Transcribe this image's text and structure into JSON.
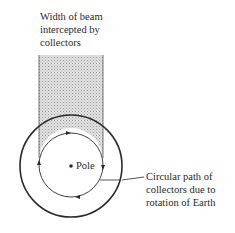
{
  "diagram": {
    "beam_label": [
      "Width of beam",
      "intercepted by",
      "collectors"
    ],
    "pole_label": "Pole",
    "path_label": [
      "Circular path of",
      "collectors due to",
      "rotation of Earth"
    ],
    "colors": {
      "stroke": "#2a2a2a",
      "beam_fill": "#d0d0d0"
    }
  }
}
